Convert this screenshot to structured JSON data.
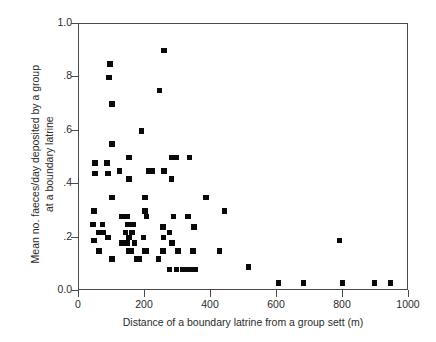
{
  "chart_data": {
    "type": "scatter",
    "title": "",
    "xlabel": "Distance of a boundary latrine from a group sett (m)",
    "ylabel_line1": "Mean no. faeces/day deposited by a group",
    "ylabel_line2": "at a boundary latrine",
    "xlim": [
      0,
      1000
    ],
    "ylim": [
      0.0,
      1.0
    ],
    "xticks": [
      0,
      200,
      400,
      600,
      800,
      1000
    ],
    "xtick_labels": [
      "0",
      "200",
      "400",
      "600",
      "800",
      "1000"
    ],
    "yticks": [
      0.0,
      0.2,
      0.4,
      0.6,
      0.8,
      1.0
    ],
    "ytick_labels": [
      "0.0",
      ".2",
      ".4",
      ".6",
      ".8",
      "1.0"
    ],
    "grid": false,
    "legend": null,
    "marker": "square",
    "marker_color": "#0a0a0a",
    "axis_color": "#4a4a4a",
    "points": [
      [
        258,
        0.9
      ],
      [
        94,
        0.85
      ],
      [
        91,
        0.8
      ],
      [
        243,
        0.75
      ],
      [
        100,
        0.7
      ],
      [
        190,
        0.6
      ],
      [
        100,
        0.55
      ],
      [
        152,
        0.5
      ],
      [
        282,
        0.5
      ],
      [
        296,
        0.5
      ],
      [
        335,
        0.5
      ],
      [
        48,
        0.48
      ],
      [
        85,
        0.48
      ],
      [
        122,
        0.45
      ],
      [
        212,
        0.45
      ],
      [
        222,
        0.45
      ],
      [
        258,
        0.45
      ],
      [
        48,
        0.44
      ],
      [
        88,
        0.44
      ],
      [
        152,
        0.42
      ],
      [
        280,
        0.42
      ],
      [
        100,
        0.35
      ],
      [
        200,
        0.35
      ],
      [
        385,
        0.35
      ],
      [
        45,
        0.3
      ],
      [
        200,
        0.3
      ],
      [
        440,
        0.3
      ],
      [
        128,
        0.28
      ],
      [
        145,
        0.28
      ],
      [
        205,
        0.28
      ],
      [
        286,
        0.28
      ],
      [
        330,
        0.28
      ],
      [
        42,
        0.25
      ],
      [
        72,
        0.25
      ],
      [
        148,
        0.25
      ],
      [
        165,
        0.25
      ],
      [
        255,
        0.24
      ],
      [
        348,
        0.24
      ],
      [
        60,
        0.22
      ],
      [
        75,
        0.22
      ],
      [
        140,
        0.22
      ],
      [
        160,
        0.22
      ],
      [
        275,
        0.22
      ],
      [
        88,
        0.2
      ],
      [
        152,
        0.2
      ],
      [
        195,
        0.2
      ],
      [
        256,
        0.2
      ],
      [
        790,
        0.19
      ],
      [
        45,
        0.19
      ],
      [
        128,
        0.18
      ],
      [
        145,
        0.18
      ],
      [
        168,
        0.18
      ],
      [
        282,
        0.18
      ],
      [
        60,
        0.15
      ],
      [
        150,
        0.15
      ],
      [
        158,
        0.15
      ],
      [
        198,
        0.15
      ],
      [
        205,
        0.15
      ],
      [
        255,
        0.15
      ],
      [
        300,
        0.15
      ],
      [
        345,
        0.15
      ],
      [
        425,
        0.15
      ],
      [
        100,
        0.12
      ],
      [
        175,
        0.12
      ],
      [
        182,
        0.12
      ],
      [
        240,
        0.12
      ],
      [
        275,
        0.08
      ],
      [
        295,
        0.08
      ],
      [
        315,
        0.08
      ],
      [
        325,
        0.08
      ],
      [
        340,
        0.08
      ],
      [
        352,
        0.08
      ],
      [
        513,
        0.09
      ],
      [
        605,
        0.03
      ],
      [
        680,
        0.03
      ],
      [
        798,
        0.03
      ],
      [
        895,
        0.03
      ],
      [
        943,
        0.03
      ]
    ]
  }
}
